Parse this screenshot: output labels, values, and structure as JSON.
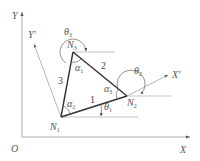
{
  "diagram": {
    "type": "triangle-element-coordinate-systems",
    "axes": {
      "global": {
        "origin_label": "O",
        "x_label": "X",
        "y_label": "Y"
      },
      "local": {
        "x_label": "X'",
        "y_label": "Y'"
      }
    },
    "nodes": [
      {
        "id": "N1",
        "label": "N",
        "sub": "1"
      },
      {
        "id": "N2",
        "label": "N",
        "sub": "2"
      },
      {
        "id": "N3",
        "label": "N",
        "sub": "3"
      }
    ],
    "edges": [
      {
        "label": "1",
        "from": "N1",
        "to": "N2"
      },
      {
        "label": "2",
        "from": "N2",
        "to": "N3"
      },
      {
        "label": "3",
        "from": "N3",
        "to": "N1"
      }
    ],
    "interior_angles": [
      {
        "label": "α",
        "sub": "1",
        "at": "N3"
      },
      {
        "label": "α",
        "sub": "2",
        "at": "N1"
      },
      {
        "label": "α",
        "sub": "3",
        "at": "N2"
      }
    ],
    "direction_angles": [
      {
        "label": "θ",
        "sub": "1",
        "at": "N1"
      },
      {
        "label": "θ",
        "sub": "2",
        "at": "N2"
      },
      {
        "label": "θ",
        "sub": "3",
        "at": "N3"
      }
    ],
    "colors": {
      "axis": "#888888",
      "triangle": "#333333",
      "text": "#555555"
    }
  }
}
